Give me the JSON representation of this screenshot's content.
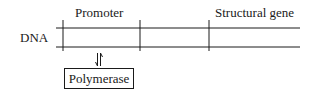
{
  "diagram": {
    "strand_label": "DNA",
    "regions": [
      {
        "label": "Promoter"
      },
      {
        "label": "Structural gene"
      }
    ],
    "binding_protein": "Polymerase",
    "arrow_icon": "reversible-binding-arrows",
    "colors": {
      "line": "#1a1a1a",
      "background": "#ffffff"
    }
  }
}
